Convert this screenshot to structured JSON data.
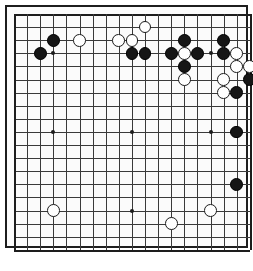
{
  "board": {
    "name": "go-board",
    "type": "go-goban",
    "size": 19,
    "columns": 19,
    "rows": 19,
    "origin_x": 9,
    "origin_y": 9,
    "spacing": 13.1,
    "stone_radius": 6.4,
    "colors": {
      "background": "#fbfbfb",
      "grid_line": "#3a3a3a",
      "border": "#1d1d1d",
      "black_stone": "#161616",
      "white_stone": "#ffffff",
      "white_stone_outline": "#1a1a1a",
      "star_point": "#1d1d1d",
      "page_background": "#ffffff"
    },
    "star_points": [
      {
        "col": 4,
        "row": 4
      },
      {
        "col": 10,
        "row": 4
      },
      {
        "col": 16,
        "row": 4
      },
      {
        "col": 4,
        "row": 10
      },
      {
        "col": 10,
        "row": 10
      },
      {
        "col": 16,
        "row": 10
      },
      {
        "col": 4,
        "row": 16
      },
      {
        "col": 10,
        "row": 16
      },
      {
        "col": 16,
        "row": 16
      }
    ],
    "stones": [
      {
        "color": "black",
        "col": 4,
        "row": 3
      },
      {
        "color": "black",
        "col": 3,
        "row": 4
      },
      {
        "color": "black",
        "col": 14,
        "row": 3
      },
      {
        "color": "black",
        "col": 17,
        "row": 3
      },
      {
        "color": "black",
        "col": 10,
        "row": 4
      },
      {
        "color": "black",
        "col": 11,
        "row": 4
      },
      {
        "color": "black",
        "col": 13,
        "row": 4
      },
      {
        "color": "black",
        "col": 15,
        "row": 4
      },
      {
        "color": "black",
        "col": 17,
        "row": 4
      },
      {
        "color": "black",
        "col": 14,
        "row": 5
      },
      {
        "color": "black",
        "col": 19,
        "row": 6
      },
      {
        "color": "black",
        "col": 18,
        "row": 7
      },
      {
        "color": "black",
        "col": 18,
        "row": 10
      },
      {
        "color": "black",
        "col": 18,
        "row": 14
      },
      {
        "color": "white",
        "col": 6,
        "row": 3
      },
      {
        "color": "white",
        "col": 9,
        "row": 3
      },
      {
        "color": "white",
        "col": 10,
        "row": 3
      },
      {
        "color": "white",
        "col": 11,
        "row": 2
      },
      {
        "color": "white",
        "col": 14,
        "row": 4
      },
      {
        "color": "white",
        "col": 18,
        "row": 4
      },
      {
        "color": "white",
        "col": 18,
        "row": 5
      },
      {
        "color": "white",
        "col": 19,
        "row": 5
      },
      {
        "color": "white",
        "col": 14,
        "row": 6
      },
      {
        "color": "white",
        "col": 17,
        "row": 6
      },
      {
        "color": "white",
        "col": 17,
        "row": 7
      },
      {
        "color": "white",
        "col": 4,
        "row": 16
      },
      {
        "color": "white",
        "col": 16,
        "row": 16
      },
      {
        "color": "white",
        "col": 13,
        "row": 17
      }
    ]
  },
  "caption": {
    "text": ""
  }
}
